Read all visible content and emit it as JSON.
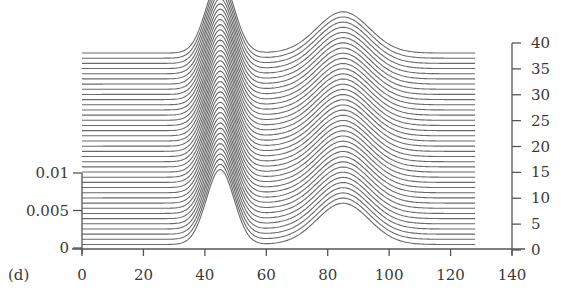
{
  "panel_label": "(d)",
  "chart_data": {
    "type": "line",
    "subtype": "waterfall",
    "title": "",
    "xlabel": "",
    "ylabel": "",
    "panel_label": "(d)",
    "x_ticks": [
      0,
      20,
      40,
      60,
      80,
      100,
      120,
      140
    ],
    "xlim": [
      0,
      140
    ],
    "left_y_ticks": [
      "0",
      "0.005",
      "0.01"
    ],
    "left_ylim": [
      0,
      0.01
    ],
    "right_y_ticks": [
      0,
      5,
      10,
      15,
      20,
      25,
      30,
      35,
      40
    ],
    "right_ylim": [
      0,
      40
    ],
    "grid": false,
    "legend": null,
    "series_count": 38,
    "trace_x_range": [
      0,
      128
    ],
    "trace_offset_per_index": 1,
    "peaks": [
      {
        "center": 45,
        "height": 0.01,
        "width_sigma": 4.5
      },
      {
        "center": 85,
        "height": 0.0055,
        "width_sigma": 8.5
      }
    ],
    "baseline": 0.0002
  },
  "colors": {
    "trace": "#6a6a6a",
    "axis": "#555555",
    "text": "#3a3a3a",
    "background": "#ffffff"
  }
}
